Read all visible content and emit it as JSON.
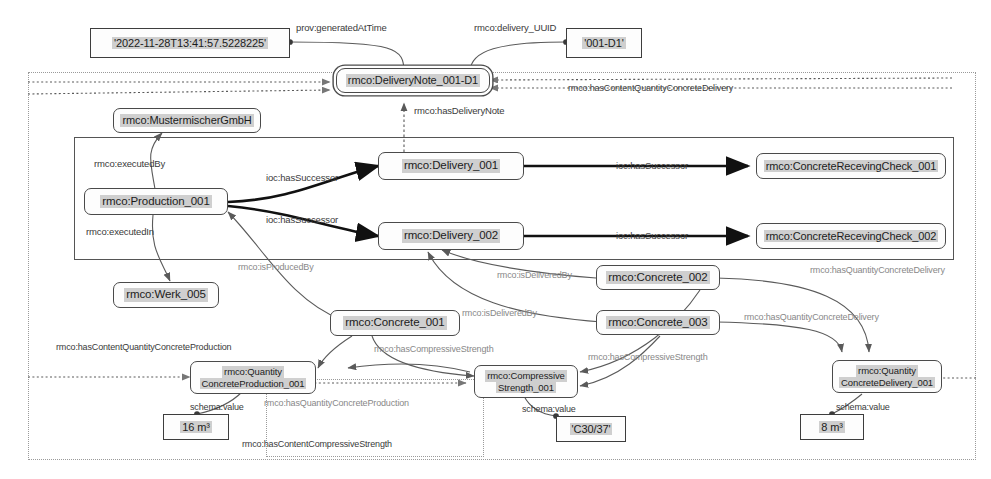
{
  "diagram": {
    "type": "rdf-graph",
    "canvas": {
      "width": 991,
      "height": 479
    },
    "colors": {
      "node_border": "#4a4a4a",
      "node_fill": "#fdfdfd",
      "text_highlight": "#cfcfcf",
      "edge": "#5a5a5a",
      "edge_bold": "#1a1a1a",
      "frame_dotted": "#9a9a9a",
      "frame_solid": "#555555",
      "background": "#ffffff"
    }
  },
  "nodes": {
    "generated_at_time": {
      "label": "'2022-11-28T13:41:57.5228225'",
      "kind": "literal"
    },
    "delivery_uuid": {
      "label": "'001-D1'",
      "kind": "literal"
    },
    "delivery_note": {
      "label": "rmco:DeliveryNote_001-D1",
      "kind": "resource-double"
    },
    "mustermischer": {
      "label": "rmco:MustermischerGmbH",
      "kind": "resource"
    },
    "production_001": {
      "label": "rmco:Production_001",
      "kind": "resource"
    },
    "werk_005": {
      "label": "rmco:Werk_005",
      "kind": "resource"
    },
    "delivery_001": {
      "label": "rmco:Delivery_001",
      "kind": "resource"
    },
    "delivery_002": {
      "label": "rmco:Delivery_002",
      "kind": "resource"
    },
    "check_001": {
      "label": "rmco:ConcreteRecevingCheck_001",
      "kind": "resource"
    },
    "check_002": {
      "label": "rmco:ConcreteRecevingCheck_002",
      "kind": "resource"
    },
    "concrete_001": {
      "label": "rmco:Concrete_001",
      "kind": "resource"
    },
    "concrete_002": {
      "label": "rmco:Concrete_002",
      "kind": "resource"
    },
    "concrete_003": {
      "label": "rmco:Concrete_003",
      "kind": "resource"
    },
    "qty_production": {
      "line1": "rmco:Quantity",
      "line2": "ConcreteProduction_001",
      "kind": "resource"
    },
    "compressive_strength": {
      "line1": "rmco:Compressive",
      "line2": "Strength_001",
      "kind": "resource"
    },
    "qty_delivery": {
      "line1": "rmco:Quantity",
      "line2": "ConcreteDelivery_001",
      "kind": "resource"
    },
    "value_16m3": {
      "label": "16 m³",
      "kind": "literal"
    },
    "value_c3037": {
      "label": "'C30/37'",
      "kind": "literal"
    },
    "value_8m3": {
      "label": "8 m³",
      "kind": "literal"
    }
  },
  "edge_labels": {
    "prov_generated_at_time": "prov:generatedAtTime",
    "delivery_uuid": "rmco:delivery_UUID",
    "has_content_quantity_concrete_delivery": "rmco:hasContentQuantityConcreteDelivery",
    "has_delivery_note": "rmco:hasDeliveryNote",
    "executed_by": "rmco:executedBy",
    "executed_in": "rmco:executedIn",
    "has_successor_1": "ioc:hasSuccessor",
    "has_successor_2": "ioc:hasSuccessor",
    "has_successor_3": "ioc:hasSuccessor",
    "has_successor_4": "ioc:hasSuccessor",
    "is_produced_by": "rmco:isProducedBy",
    "is_delivered_by_1": "rmco:isDeliveredBy",
    "is_delivered_by_2": "rmco:isDeliveredBy",
    "has_quantity_concrete_delivery_1": "rmco:hasQuantityConcreteDelivery",
    "has_quantity_concrete_delivery_2": "rmco:hasQuantityConcreteDelivery",
    "has_content_quantity_concrete_production": "rmco:hasContentQuantityConcreteProduction",
    "has_quantity_concrete_production": "rmco:hasQuantityConcreteProduction",
    "has_compressive_strength_1": "rmco:hasCompressiveStrength",
    "has_compressive_strength_2": "rmco:hasCompressiveStrength",
    "has_content_compressive_strength": "rmco:hasContentCompressiveStrength",
    "schema_value_1": "schema:value",
    "schema_value_2": "schema:value",
    "schema_value_3": "schema:value"
  },
  "triples": [
    {
      "subject": "rmco:DeliveryNote_001-D1",
      "predicate": "prov:generatedAtTime",
      "object": "'2022-11-28T13:41:57.5228225'"
    },
    {
      "subject": "rmco:DeliveryNote_001-D1",
      "predicate": "rmco:delivery_UUID",
      "object": "'001-D1'"
    },
    {
      "subject": "rmco:Production_001",
      "predicate": "rmco:executedBy",
      "object": "rmco:MustermischerGmbH"
    },
    {
      "subject": "rmco:Production_001",
      "predicate": "rmco:executedIn",
      "object": "rmco:Werk_005"
    },
    {
      "subject": "rmco:Production_001",
      "predicate": "ioc:hasSuccessor",
      "object": "rmco:Delivery_001"
    },
    {
      "subject": "rmco:Production_001",
      "predicate": "ioc:hasSuccessor",
      "object": "rmco:Delivery_002"
    },
    {
      "subject": "rmco:Delivery_001",
      "predicate": "ioc:hasSuccessor",
      "object": "rmco:ConcreteRecevingCheck_001"
    },
    {
      "subject": "rmco:Delivery_002",
      "predicate": "ioc:hasSuccessor",
      "object": "rmco:ConcreteRecevingCheck_002"
    },
    {
      "subject": "rmco:Delivery_001",
      "predicate": "rmco:hasDeliveryNote",
      "object": "rmco:DeliveryNote_001-D1"
    },
    {
      "subject": "rmco:Concrete_001",
      "predicate": "rmco:isProducedBy",
      "object": "rmco:Production_001"
    },
    {
      "subject": "rmco:Concrete_002",
      "predicate": "rmco:isDeliveredBy",
      "object": "rmco:Delivery_001"
    },
    {
      "subject": "rmco:Concrete_003",
      "predicate": "rmco:isDeliveredBy",
      "object": "rmco:Delivery_002"
    },
    {
      "subject": "rmco:Concrete_001",
      "predicate": "rmco:hasCompressiveStrength",
      "object": "rmco:CompressiveStrength_001"
    },
    {
      "subject": "rmco:Concrete_002",
      "predicate": "rmco:hasCompressiveStrength",
      "object": "rmco:CompressiveStrength_001"
    },
    {
      "subject": "rmco:Concrete_003",
      "predicate": "rmco:hasCompressiveStrength",
      "object": "rmco:CompressiveStrength_001"
    },
    {
      "subject": "rmco:Concrete_002",
      "predicate": "rmco:hasQuantityConcreteDelivery",
      "object": "rmco:QuantityConcreteDelivery_001"
    },
    {
      "subject": "rmco:Concrete_003",
      "predicate": "rmco:hasQuantityConcreteDelivery",
      "object": "rmco:QuantityConcreteDelivery_001"
    },
    {
      "subject": "rmco:Concrete_001",
      "predicate": "rmco:hasQuantityConcreteProduction",
      "object": "rmco:QuantityConcreteProduction_001"
    },
    {
      "subject": "rmco:QuantityConcreteProduction_001",
      "predicate": "schema:value",
      "object": "16 m³"
    },
    {
      "subject": "rmco:CompressiveStrength_001",
      "predicate": "schema:value",
      "object": "'C30/37'"
    },
    {
      "subject": "rmco:QuantityConcreteDelivery_001",
      "predicate": "schema:value",
      "object": "8 m³"
    }
  ]
}
